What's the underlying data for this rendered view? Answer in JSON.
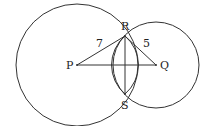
{
  "diagram": {
    "type": "geometry",
    "colors": {
      "stroke": "#333333",
      "text": "#222222",
      "background": "#ffffff"
    },
    "points": {
      "P": {
        "label": "P",
        "x": 77,
        "y": 65
      },
      "Q": {
        "label": "Q",
        "x": 156,
        "y": 65
      },
      "R": {
        "label": "R",
        "x": 125,
        "y": 36
      },
      "S": {
        "label": "S",
        "x": 125,
        "y": 94
      }
    },
    "circles": [
      {
        "name": "circle-P",
        "center": "P",
        "cx": 77,
        "cy": 65,
        "r": 61
      },
      {
        "name": "circle-Q",
        "center": "Q",
        "cx": 156,
        "cy": 65,
        "r": 43
      },
      {
        "name": "arc-left",
        "cx": 152,
        "cy": 65,
        "r": 38
      },
      {
        "name": "arc-right",
        "cx": 98,
        "cy": 65,
        "r": 38
      }
    ],
    "segments": [
      {
        "from": "P",
        "to": "R",
        "length_label": "7"
      },
      {
        "from": "R",
        "to": "Q",
        "length_label": "5"
      },
      {
        "from": "P",
        "to": "Q",
        "length_label": ""
      },
      {
        "from": "R",
        "to": "S",
        "length_label": ""
      }
    ],
    "labels": {
      "P": "P",
      "Q": "Q",
      "R": "R",
      "S": "S",
      "PR": "7",
      "RQ": "5"
    }
  }
}
